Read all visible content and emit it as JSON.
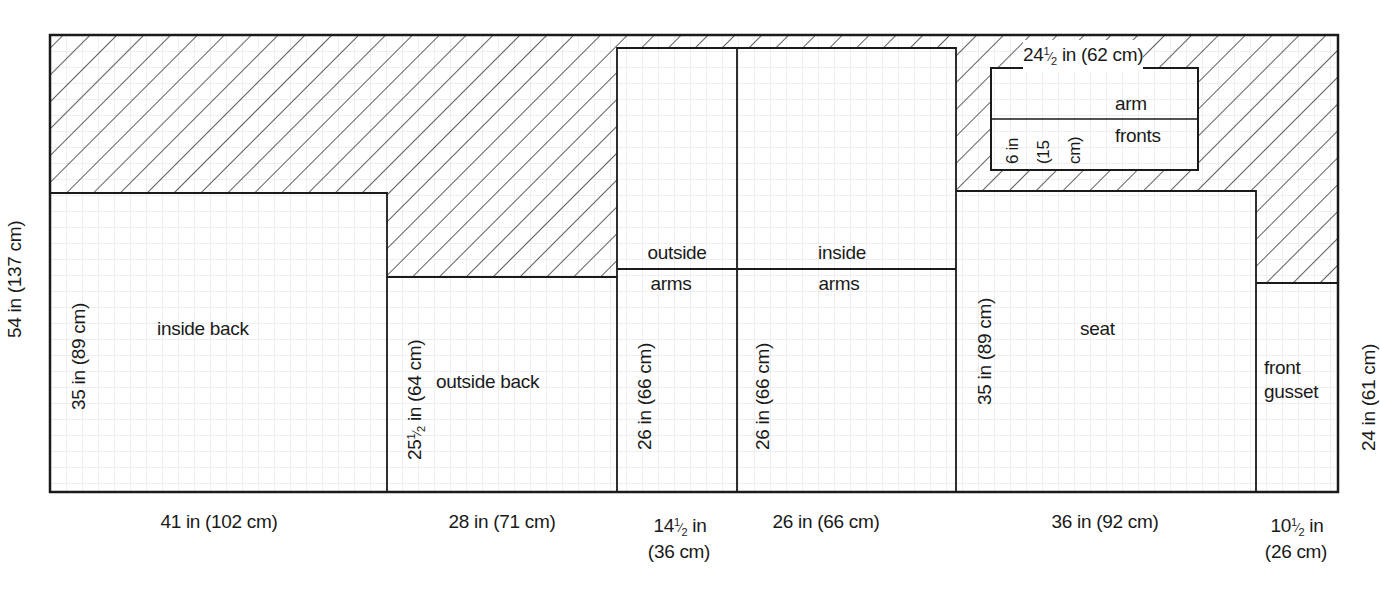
{
  "diagram": {
    "type": "fabric cutting layout",
    "overall_height_label": "54 in (137 cm)",
    "grid": {
      "minor_spacing_px": 16,
      "color": "#dcdcdc"
    },
    "colors": {
      "line": "#1a1a1a",
      "hatch": "#1a1a1a",
      "background": "#ffffff"
    },
    "pieces": [
      {
        "name": "inside back",
        "label": "inside back",
        "width_label": "41 in (102 cm)",
        "height_label": "35 in (89 cm)"
      },
      {
        "name": "outside back",
        "label": "outside back",
        "width_label": "28 in (71 cm)",
        "height_label_whole": "25",
        "height_label_frac_num": "1",
        "height_label_frac_den": "2",
        "height_label_rest": "in (64 cm)"
      },
      {
        "name": "outside arms",
        "label_line1": "outside",
        "label_line2": "arms",
        "width_label_whole": "14",
        "width_label_frac_num": "1",
        "width_label_frac_den": "2",
        "width_label_rest": "in",
        "width_label_cm": "(36 cm)",
        "height_label": "26 in (66 cm)"
      },
      {
        "name": "inside arms",
        "label_line1": "inside",
        "label_line2": "arms",
        "width_label": "26 in (66 cm)",
        "height_label": "26 in (66 cm)"
      },
      {
        "name": "arm fronts",
        "label_line1": "arm",
        "label_line2": "fronts",
        "width_label_whole": "24",
        "width_label_frac_num": "1",
        "width_label_frac_den": "2",
        "width_label_rest": "in (62 cm)",
        "height_label_1": "6 in",
        "height_label_2": "(15",
        "height_label_3": "cm)"
      },
      {
        "name": "seat",
        "label": "seat",
        "width_label": "36 in (92 cm)",
        "height_label": "35 in (89 cm)"
      },
      {
        "name": "front gusset",
        "label_line1": "front",
        "label_line2": "gusset",
        "width_label_whole": "10",
        "width_label_frac_num": "1",
        "width_label_frac_den": "2",
        "width_label_rest": "in",
        "width_label_cm": "(26 cm)",
        "height_label": "24 in (61 cm)"
      }
    ],
    "waste_area": "hatched"
  }
}
